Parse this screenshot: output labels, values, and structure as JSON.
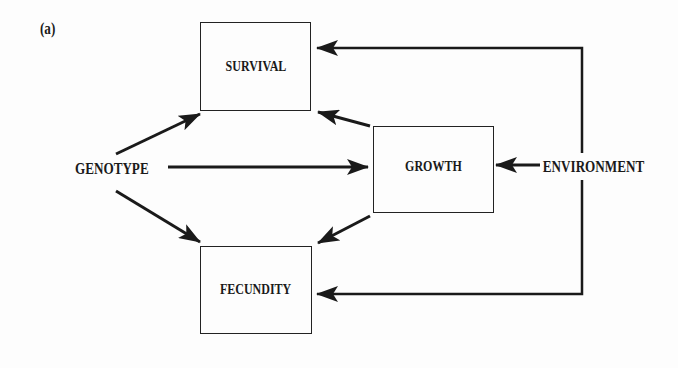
{
  "figure": {
    "panel_label": "(a)",
    "nodes": {
      "survival": "SURVIVAL",
      "growth": "GROWTH",
      "fecundity": "FECUNDITY",
      "genotype": "GENOTYPE",
      "environment": "ENVIRONMENT"
    },
    "edges": [
      {
        "from": "GENOTYPE",
        "to": "SURVIVAL"
      },
      {
        "from": "GENOTYPE",
        "to": "GROWTH"
      },
      {
        "from": "GENOTYPE",
        "to": "FECUNDITY"
      },
      {
        "from": "GROWTH",
        "to": "SURVIVAL"
      },
      {
        "from": "GROWTH",
        "to": "FECUNDITY"
      },
      {
        "from": "ENVIRONMENT",
        "to": "GROWTH"
      },
      {
        "from": "ENVIRONMENT",
        "to": "SURVIVAL"
      },
      {
        "from": "ENVIRONMENT",
        "to": "FECUNDITY"
      }
    ],
    "colors": {
      "ink": "#1a1a1a",
      "background": "#fdfdfd"
    }
  }
}
